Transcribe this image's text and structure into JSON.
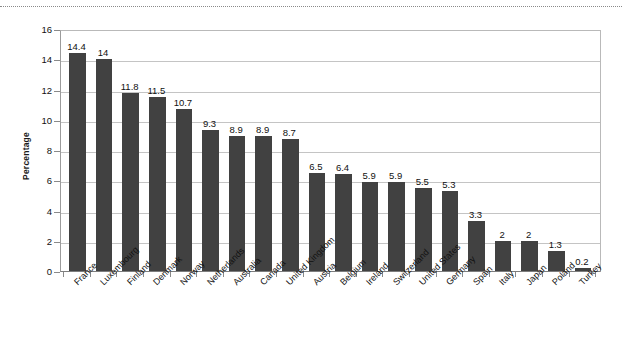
{
  "chart_data": {
    "type": "bar",
    "title": "",
    "subtitle": "",
    "xlabel": "",
    "ylabel": "Percentage",
    "ylim": [
      0,
      16
    ],
    "ytick_values": [
      0,
      2,
      4,
      6,
      8,
      10,
      12,
      14,
      16
    ],
    "ytick_labels": [
      "0",
      "2",
      "4",
      "6",
      "8",
      "10",
      "12",
      "14",
      "16"
    ],
    "grid": "horizontal",
    "legend": "none",
    "bar_color": "#414141",
    "categories": [
      "France",
      "Luxembourg",
      "Finland",
      "Denmark",
      "Norway",
      "Netherlands",
      "Australia",
      "Canada",
      "United Kingdom",
      "Austria",
      "Belgium",
      "Ireland",
      "Switzerland",
      "United States",
      "Germany",
      "Spain",
      "Italy",
      "Japan",
      "Poland",
      "Turkey"
    ],
    "values": [
      14.4,
      14,
      11.8,
      11.5,
      10.7,
      9.3,
      8.9,
      8.9,
      8.7,
      6.5,
      6.4,
      5.9,
      5.9,
      5.5,
      5.3,
      3.3,
      2,
      2,
      1.3,
      0.2
    ],
    "value_labels": [
      "14.4",
      "14",
      "11.8",
      "11.5",
      "10.7",
      "9.3",
      "8.9",
      "8.9",
      "8.7",
      "6.5",
      "6.4",
      "5.9",
      "5.9",
      "5.5",
      "5.3",
      "3.3",
      "2",
      "2",
      "1.3",
      "0.2"
    ]
  }
}
